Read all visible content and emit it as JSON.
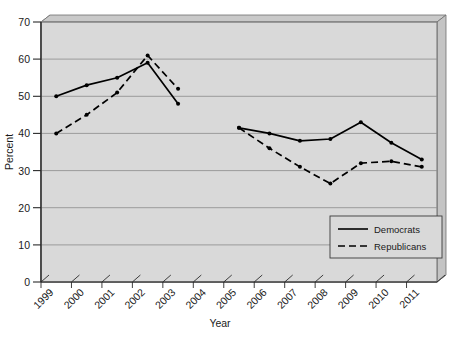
{
  "chart_data": {
    "type": "line",
    "title": "",
    "xlabel": "Year",
    "ylabel": "Percent",
    "categories": [
      "1999",
      "2000",
      "2001",
      "2002",
      "2003",
      "2004",
      "2005",
      "2006",
      "2007",
      "2008",
      "2009",
      "2010",
      "2011"
    ],
    "ylim": [
      0,
      70
    ],
    "ytick_labels": [
      "0",
      "10",
      "20",
      "30",
      "40",
      "50",
      "60",
      "70"
    ],
    "ytick_values": [
      0,
      10,
      20,
      30,
      40,
      50,
      60,
      70
    ],
    "grid": true,
    "grid_axis": "y",
    "legend_position": "bottom-right",
    "series": [
      {
        "name": "Democrats",
        "style": "solid",
        "color": "#000000",
        "values": [
          50,
          53,
          55,
          59,
          48,
          null,
          41.5,
          40,
          38,
          38.5,
          43,
          37.5,
          33
        ]
      },
      {
        "name": "Republicans",
        "style": "dashed",
        "color": "#000000",
        "values": [
          40,
          45,
          51,
          61,
          52,
          null,
          41.5,
          36,
          31,
          26.5,
          32,
          32.5,
          31
        ]
      }
    ]
  },
  "axes": {
    "y_title": "Percent",
    "x_title": "Year",
    "y_ticks": [
      "70",
      "60",
      "50",
      "40",
      "30",
      "20",
      "10",
      "0"
    ],
    "x_ticks": [
      "1999",
      "2000",
      "2001",
      "2002",
      "2003",
      "2004",
      "2005",
      "2006",
      "2007",
      "2008",
      "2009",
      "2010",
      "2011"
    ]
  },
  "legend": {
    "items": [
      {
        "label": "Democrats",
        "style": "solid"
      },
      {
        "label": "Republicans",
        "style": "dashed"
      }
    ]
  },
  "colors": {
    "plot_background": "#d9d9d9",
    "panel_side": "#b5b5b5",
    "gridline": "#8c8c8c",
    "line": "#000000",
    "frame": "#6e6e6e",
    "page_background": "#ffffff"
  }
}
